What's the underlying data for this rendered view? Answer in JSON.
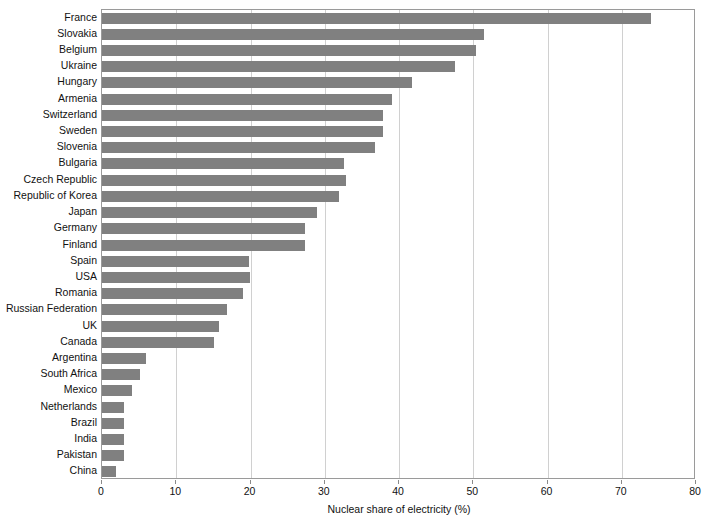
{
  "chart_data": {
    "type": "bar",
    "orientation": "horizontal",
    "title": "",
    "xlabel": "Nuclear share of electricity (%)",
    "ylabel": "",
    "xlim": [
      0,
      80
    ],
    "xticks": [
      0,
      10,
      20,
      30,
      40,
      50,
      60,
      70,
      80
    ],
    "grid": "vertical",
    "legend": "none",
    "bar_color": "#808080",
    "frame_color": "#9a9a9a",
    "gridline_color": "#d0d0d0",
    "categories": [
      "France",
      "Slovakia",
      "Belgium",
      "Ukraine",
      "Hungary",
      "Armenia",
      "Switzerland",
      "Sweden",
      "Slovenia",
      "Bulgaria",
      "Czech Republic",
      "Republic of Korea",
      "Japan",
      "Germany",
      "Finland",
      "Spain",
      "USA",
      "Romania",
      "Russian Federation",
      "UK",
      "Canada",
      "Argentina",
      "South Africa",
      "Mexico",
      "Netherlands",
      "Brazil",
      "India",
      "Pakistan",
      "China"
    ],
    "values": [
      73.9,
      51.5,
      50.4,
      47.5,
      41.7,
      39.0,
      37.9,
      37.8,
      36.8,
      32.6,
      32.8,
      31.9,
      28.9,
      27.3,
      27.4,
      19.8,
      19.9,
      19.0,
      16.9,
      15.7,
      15.1,
      5.9,
      5.1,
      4.0,
      2.9,
      3.0,
      2.9,
      2.9,
      1.9
    ]
  }
}
